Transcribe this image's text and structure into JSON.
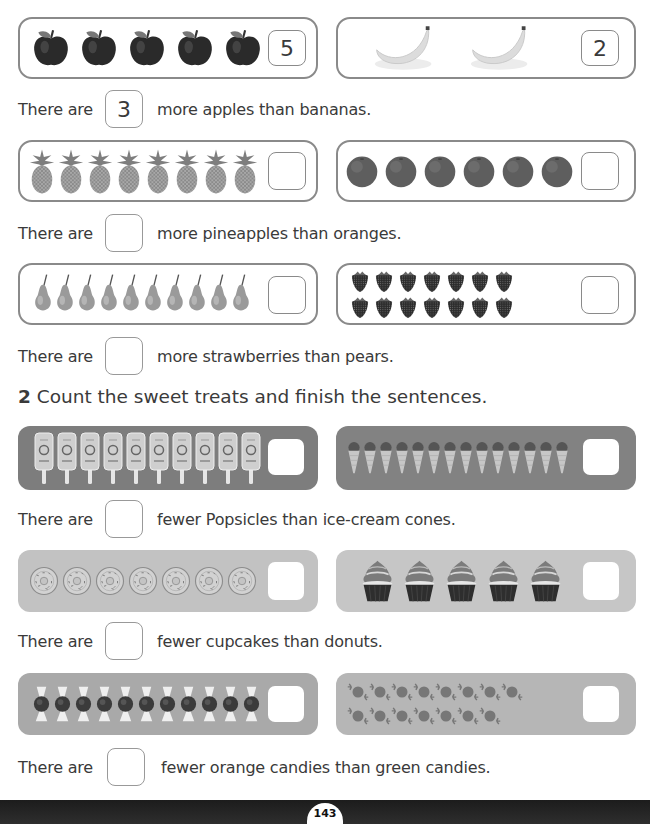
{
  "colors": {
    "outline_border": "#8a8a8a",
    "popsicle_panel": "#7d7d7d",
    "icecream_panel": "#828282",
    "donut_panel": "#c2c2c2",
    "cupcake_panel": "#c6c6c6",
    "orange_candy_panel": "#a9a9a9",
    "green_candy_panel": "#b6b6b6",
    "footer": "#222222"
  },
  "section1": {
    "rows": [
      {
        "left": {
          "item": "apple",
          "icon": "apple-icon",
          "count": 5,
          "answer": "5"
        },
        "right": {
          "item": "banana",
          "icon": "banana-icon",
          "count": 2,
          "answer": "2"
        },
        "sentence": {
          "prefix": "There are",
          "answer": "3",
          "suffix": "more apples than bananas."
        }
      },
      {
        "left": {
          "item": "pineapple",
          "icon": "pineapple-icon",
          "count": 8,
          "answer": ""
        },
        "right": {
          "item": "orange",
          "icon": "orange-icon",
          "count": 6,
          "answer": ""
        },
        "sentence": {
          "prefix": "There are",
          "answer": "",
          "suffix": "more pineapples than oranges."
        }
      },
      {
        "left": {
          "item": "pear",
          "icon": "pear-icon",
          "count": 10,
          "answer": ""
        },
        "right": {
          "item": "strawberry",
          "icon": "strawberry-icon",
          "count": 14,
          "answer": ""
        },
        "sentence": {
          "prefix": "There are",
          "answer": "",
          "suffix": "more strawberries than pears."
        }
      }
    ]
  },
  "section2": {
    "number": "2",
    "instruction": "Count the sweet treats and finish the sentences.",
    "rows": [
      {
        "left": {
          "item": "popsicle",
          "icon": "popsicle-icon",
          "count": 10,
          "answer": ""
        },
        "right": {
          "item": "ice-cream cone",
          "icon": "ice-cream-cone-icon",
          "count": 14,
          "answer": ""
        },
        "sentence": {
          "prefix": "There are",
          "answer": "",
          "suffix": "fewer Popsicles than ice-cream cones."
        }
      },
      {
        "left": {
          "item": "donut",
          "icon": "donut-icon",
          "count": 7,
          "answer": ""
        },
        "right": {
          "item": "cupcake",
          "icon": "cupcake-icon",
          "count": 5,
          "answer": ""
        },
        "sentence": {
          "prefix": "There are",
          "answer": "",
          "suffix": "fewer cupcakes than donuts."
        }
      },
      {
        "left": {
          "item": "orange candy",
          "icon": "orange-candy-icon",
          "count": 11,
          "answer": ""
        },
        "right": {
          "item": "green candy",
          "icon": "green-candy-icon",
          "count": 15,
          "answer": ""
        },
        "sentence": {
          "prefix": "There are",
          "answer": "",
          "suffix": "fewer orange candies than green candies."
        }
      }
    ]
  },
  "footer": {
    "page_number": "143"
  }
}
